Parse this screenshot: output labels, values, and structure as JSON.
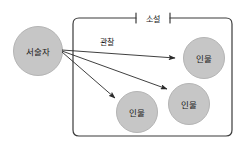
{
  "diagram": {
    "type": "concept-diagram",
    "title_visible": false,
    "background_color": "#ffffff",
    "container": {
      "label": "소설",
      "shape": "rounded-rectangle",
      "stroke_color": "#3b3b3b",
      "fill_color": "#ffffff",
      "x": 73,
      "y": 18,
      "width": 159,
      "height": 118,
      "label_x": 153,
      "label_y": 18,
      "tick_left_x": 136,
      "tick_right_x": 170,
      "tick_half_height": 5
    },
    "nodes": [
      {
        "id": "narrator",
        "label": "서술자",
        "shape": "circle",
        "cx": 38,
        "cy": 51,
        "r": 24.5,
        "fill_color": "#c6c6c6",
        "stroke_color": "#b4b4b4",
        "inside_container": false
      },
      {
        "id": "character-1",
        "label": "인물",
        "shape": "circle",
        "cx": 204,
        "cy": 58,
        "r": 20.5,
        "fill_color": "#c6c6c6",
        "stroke_color": "#b4b4b4",
        "inside_container": true
      },
      {
        "id": "character-2",
        "label": "인물",
        "shape": "circle",
        "cx": 189,
        "cy": 104,
        "r": 20.5,
        "fill_color": "#c6c6c6",
        "stroke_color": "#b4b4b4",
        "inside_container": true
      },
      {
        "id": "character-3",
        "label": "인물",
        "shape": "circle",
        "cx": 137,
        "cy": 112,
        "r": 20.5,
        "fill_color": "#c6c6c6",
        "stroke_color": "#b4b4b4",
        "inside_container": true
      }
    ],
    "edges": [
      {
        "id": "edge-narrator-character-1",
        "from": "narrator",
        "to": "character-1",
        "label": "관찰",
        "x1": 62,
        "y1": 50,
        "x2": 175,
        "y2": 58,
        "stroke_color": "#2a2a2a",
        "arrowhead": "solid-triangle"
      },
      {
        "id": "edge-narrator-character-2",
        "from": "narrator",
        "to": "character-2",
        "label": "",
        "x1": 62,
        "y1": 51,
        "x2": 167,
        "y2": 89,
        "stroke_color": "#2a2a2a",
        "arrowhead": "solid-triangle"
      },
      {
        "id": "edge-narrator-character-3",
        "from": "narrator",
        "to": "character-3",
        "label": "",
        "x1": 62,
        "y1": 52,
        "x2": 115,
        "y2": 98,
        "stroke_color": "#2a2a2a",
        "arrowhead": "solid-triangle"
      }
    ],
    "edge_label": {
      "text": "관찰",
      "x": 107,
      "y": 41
    }
  }
}
